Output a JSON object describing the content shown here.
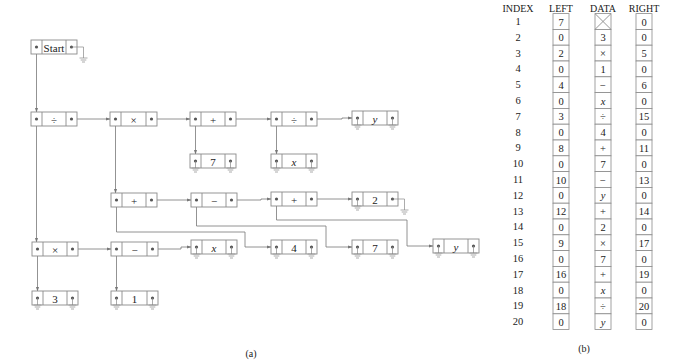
{
  "figure_a": {
    "caption": "(a)",
    "nodes": [
      {
        "id": "start",
        "label": "Start",
        "x": 31,
        "y": 40,
        "w": 46,
        "left_null": false,
        "right_null": true
      },
      {
        "id": "n7",
        "label": "÷",
        "x": 31,
        "y": 112,
        "w": 46,
        "left_null": false,
        "right_null": false
      },
      {
        "id": "n15",
        "label": "×",
        "x": 110,
        "y": 112,
        "w": 47,
        "left_null": false,
        "right_null": false
      },
      {
        "id": "n17",
        "label": "+",
        "x": 190,
        "y": 112,
        "w": 46,
        "left_null": false,
        "right_null": false
      },
      {
        "id": "n19",
        "label": "÷",
        "x": 271,
        "y": 112,
        "w": 46,
        "left_null": false,
        "right_null": false
      },
      {
        "id": "n20",
        "label": "y",
        "x": 352,
        "y": 111,
        "w": 46,
        "italic": true,
        "left_null": true,
        "right_null": true
      },
      {
        "id": "n16",
        "label": "7",
        "x": 190,
        "y": 154,
        "w": 46,
        "left_null": true,
        "right_null": true
      },
      {
        "id": "n18",
        "label": "x",
        "x": 271,
        "y": 154,
        "w": 46,
        "italic": true,
        "left_null": true,
        "right_null": true
      },
      {
        "id": "n9",
        "label": "+",
        "x": 111,
        "y": 193,
        "w": 46,
        "left_null": false,
        "right_null": false
      },
      {
        "id": "n11",
        "label": "−",
        "x": 191,
        "y": 193,
        "w": 46,
        "left_null": false,
        "right_null": false
      },
      {
        "id": "n13",
        "label": "+",
        "x": 271,
        "y": 192,
        "w": 46,
        "left_null": false,
        "right_null": false
      },
      {
        "id": "n14",
        "label": "2",
        "x": 352,
        "y": 192,
        "w": 46,
        "left_null": true,
        "right_null": true
      },
      {
        "id": "n3",
        "label": "×",
        "x": 32,
        "y": 242,
        "w": 46,
        "left_null": false,
        "right_null": false
      },
      {
        "id": "n5",
        "label": "−",
        "x": 111,
        "y": 242,
        "w": 47,
        "left_null": false,
        "right_null": false
      },
      {
        "id": "n6",
        "label": "x",
        "x": 191,
        "y": 240,
        "w": 46,
        "italic": true,
        "left_null": true,
        "right_null": true
      },
      {
        "id": "n8",
        "label": "4",
        "x": 271,
        "y": 240,
        "w": 46,
        "left_null": true,
        "right_null": true
      },
      {
        "id": "n10",
        "label": "7",
        "x": 352,
        "y": 240,
        "w": 46,
        "left_null": true,
        "right_null": true
      },
      {
        "id": "n12",
        "label": "y",
        "x": 433,
        "y": 239,
        "w": 46,
        "italic": true,
        "left_null": true,
        "right_null": true
      },
      {
        "id": "n2",
        "label": "3",
        "x": 32,
        "y": 291,
        "w": 46,
        "left_null": true,
        "right_null": true
      },
      {
        "id": "n4",
        "label": "1",
        "x": 111,
        "y": 291,
        "w": 47,
        "left_null": true,
        "right_null": true
      }
    ],
    "edges": [
      {
        "from": "start",
        "side": "left",
        "to": "n7"
      },
      {
        "from": "n7",
        "side": "right",
        "to": "n15"
      },
      {
        "from": "n15",
        "side": "right",
        "to": "n17"
      },
      {
        "from": "n17",
        "side": "right",
        "to": "n19"
      },
      {
        "from": "n19",
        "side": "right",
        "to": "n20"
      },
      {
        "from": "n17",
        "side": "left",
        "to": "n16"
      },
      {
        "from": "n19",
        "side": "left",
        "to": "n18"
      },
      {
        "from": "n7",
        "side": "left",
        "to": "n3"
      },
      {
        "from": "n15",
        "side": "left",
        "to": "n9"
      },
      {
        "from": "n9",
        "side": "right",
        "to": "n11"
      },
      {
        "from": "n11",
        "side": "right",
        "to": "n13"
      },
      {
        "from": "n13",
        "side": "right",
        "to": "n14"
      },
      {
        "from": "n9",
        "side": "left",
        "to": "n8",
        "route": [
          [
            116,
            232
          ],
          [
            245,
            232
          ]
        ]
      },
      {
        "from": "n11",
        "side": "left",
        "to": "n10",
        "route": [
          [
            196,
            226
          ],
          [
            326,
            226
          ]
        ]
      },
      {
        "from": "n13",
        "side": "left",
        "to": "n12",
        "route": [
          [
            276,
            220
          ],
          [
            407,
            220
          ]
        ]
      },
      {
        "from": "n3",
        "side": "right",
        "to": "n5"
      },
      {
        "from": "n5",
        "side": "right",
        "to": "n6"
      },
      {
        "from": "n3",
        "side": "left",
        "to": "n2"
      },
      {
        "from": "n5",
        "side": "left",
        "to": "n4"
      }
    ]
  },
  "figure_b": {
    "caption": "(b)",
    "headers": {
      "index": "INDEX",
      "left": "LEFT",
      "data": "DATA",
      "right": "RIGHT"
    },
    "rows": [
      {
        "index": "1",
        "left": "7",
        "data": "",
        "data_crossed": true,
        "right": "0"
      },
      {
        "index": "2",
        "left": "0",
        "data": "3",
        "right": "0"
      },
      {
        "index": "3",
        "left": "2",
        "data": "×",
        "right": "5"
      },
      {
        "index": "4",
        "left": "0",
        "data": "1",
        "right": "0"
      },
      {
        "index": "5",
        "left": "4",
        "data": "−",
        "right": "6"
      },
      {
        "index": "6",
        "left": "0",
        "data": "x",
        "italic": true,
        "right": "0"
      },
      {
        "index": "7",
        "left": "3",
        "data": "÷",
        "right": "15"
      },
      {
        "index": "8",
        "left": "0",
        "data": "4",
        "right": "0"
      },
      {
        "index": "9",
        "left": "8",
        "data": "+",
        "right": "11"
      },
      {
        "index": "10",
        "left": "0",
        "data": "7",
        "right": "0"
      },
      {
        "index": "11",
        "left": "10",
        "data": "−",
        "right": "13"
      },
      {
        "index": "12",
        "left": "0",
        "data": "y",
        "italic": true,
        "right": "0"
      },
      {
        "index": "13",
        "left": "12",
        "data": "+",
        "right": "14"
      },
      {
        "index": "14",
        "left": "0",
        "data": "2",
        "right": "0"
      },
      {
        "index": "15",
        "left": "9",
        "data": "×",
        "right": "17"
      },
      {
        "index": "16",
        "left": "0",
        "data": "7",
        "right": "0"
      },
      {
        "index": "17",
        "left": "16",
        "data": "+",
        "right": "19"
      },
      {
        "index": "18",
        "left": "0",
        "data": "x",
        "italic": true,
        "right": "0"
      },
      {
        "index": "19",
        "left": "18",
        "data": "÷",
        "right": "20"
      },
      {
        "index": "20",
        "left": "0",
        "data": "y",
        "italic": true,
        "right": "0"
      }
    ]
  }
}
